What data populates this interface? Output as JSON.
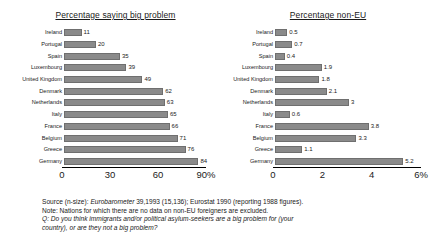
{
  "chart_data": [
    {
      "type": "bar",
      "title": "Percentage saying big problem",
      "orientation": "horizontal",
      "xlabel": "",
      "ylabel": "",
      "xlim": [
        0,
        90
      ],
      "axis_ticks": [
        "0",
        "30",
        "60",
        "90%"
      ],
      "axis_tick_values": [
        0,
        30,
        60,
        90
      ],
      "grid": false,
      "legend": "none",
      "categories": [
        "Ireland",
        "Portugal",
        "Spain",
        "Luxembourg",
        "United Kingdom",
        "Denmark",
        "Netherlands",
        "Italy",
        "France",
        "Belgium",
        "Greece",
        "Germany"
      ],
      "values": [
        11,
        20,
        35,
        39,
        49,
        62,
        63,
        65,
        66,
        71,
        76,
        84
      ],
      "value_labels": [
        "11",
        "20",
        "35",
        "39",
        "49",
        "62",
        "63",
        "65",
        "66",
        "71",
        "76",
        "84"
      ],
      "bar_color": "#8a8a8a"
    },
    {
      "type": "bar",
      "title": "Percentage non-EU",
      "orientation": "horizontal",
      "xlabel": "",
      "ylabel": "",
      "xlim": [
        0,
        6
      ],
      "axis_ticks": [
        "0",
        "2",
        "4",
        "6%"
      ],
      "axis_tick_values": [
        0,
        2,
        4,
        6
      ],
      "grid": false,
      "legend": "none",
      "categories": [
        "Ireland",
        "Portugal",
        "Spain",
        "Luxembourg",
        "United Kingdom",
        "Denmark",
        "Netherlands",
        "Italy",
        "France",
        "Belgium",
        "Greece",
        "Germany"
      ],
      "values": [
        0.5,
        0.7,
        0.4,
        1.9,
        1.8,
        2.1,
        3,
        0.6,
        3.8,
        3.3,
        1.1,
        5.2
      ],
      "value_labels": [
        "0.5",
        "0.7",
        "0.4",
        "1.9",
        "1.8",
        "2.1",
        "3",
        "0.6",
        "3.8",
        "3.3",
        "1.1",
        "5.2"
      ],
      "bar_color": "#8a8a8a"
    }
  ],
  "notes": {
    "source_prefix": "Source (n-size): ",
    "source_italic_1": "Eurobarometer",
    "source_mid": " 39,1993 (15,136); Eurostat 1990 (reporting 1988 figures).",
    "note_line": "Note: Nations for which there are no data on non-EU foreigners are excluded.",
    "question_line_1": "Q: Do you think immigrants and/or political asylum-seekers are a big problem for (your",
    "question_line_2": "country), or are they not a big problem?"
  }
}
